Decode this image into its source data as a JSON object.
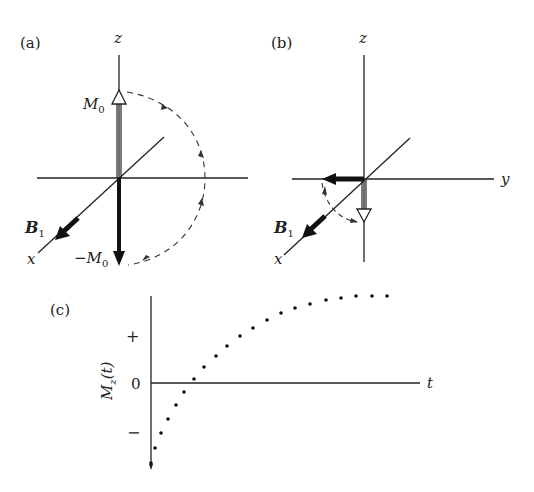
{
  "panel_a": {
    "label": "(a)",
    "z_axis": "z",
    "x_axis": "x",
    "m0_main": "M",
    "m0_sub": "0",
    "neg_m0_prefix": "−M",
    "neg_m0_sub": "0",
    "b1_main": "B",
    "b1_sub": "1"
  },
  "panel_b": {
    "label": "(b)",
    "z_axis": "z",
    "y_axis": "y",
    "x_axis": "x",
    "b1_main": "B",
    "b1_sub": "1"
  },
  "panel_c": {
    "label": "(c)",
    "ylabel_main": "M",
    "ylabel_sub": "z",
    "ylabel_arg": "(t)",
    "xlabel": "t",
    "tick_plus": "+",
    "tick_zero": "0",
    "tick_minus": "−"
  },
  "chart_data": {
    "type": "scatter",
    "title": "(c)",
    "xlabel": "t",
    "ylabel": "M_z(t)",
    "y_ticks": [
      "+",
      "0",
      "−"
    ],
    "points_px": [
      [
        151,
        463
      ],
      [
        155,
        448
      ],
      [
        161,
        433
      ],
      [
        168,
        419
      ],
      [
        176,
        405
      ],
      [
        184,
        392
      ],
      [
        194,
        379
      ],
      [
        204,
        367
      ],
      [
        216,
        356
      ],
      [
        227,
        346
      ],
      [
        240,
        336
      ],
      [
        253,
        328
      ],
      [
        267,
        320
      ],
      [
        281,
        313
      ],
      [
        295,
        308
      ],
      [
        310,
        304
      ],
      [
        326,
        300
      ],
      [
        341,
        298
      ],
      [
        356,
        296
      ],
      [
        372,
        296
      ],
      [
        387,
        296
      ]
    ],
    "points_normalized": {
      "x": [
        0,
        0.05,
        0.11,
        0.18,
        0.26,
        0.34,
        0.44,
        0.54,
        0.66,
        0.77,
        0.9,
        1.03,
        1.17,
        1.31,
        1.45,
        1.6,
        1.76,
        1.91,
        2.06,
        2.22,
        2.37
      ],
      "y": [
        -1.6,
        -1.3,
        -1.0,
        -0.72,
        -0.44,
        -0.18,
        0.08,
        0.32,
        0.54,
        0.74,
        0.94,
        1.1,
        1.26,
        1.4,
        1.5,
        1.58,
        1.66,
        1.7,
        1.74,
        1.74,
        1.74
      ]
    }
  }
}
